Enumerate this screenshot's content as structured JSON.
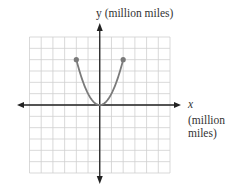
{
  "chart_data": {
    "type": "line",
    "title": "",
    "xlabel": "x (million miles)",
    "ylabel": "y (million miles)",
    "xlim": [
      -6,
      6
    ],
    "ylim": [
      -6,
      6
    ],
    "grid": true,
    "tick_labels": false,
    "series": [
      {
        "name": "y = x^2",
        "x": [
          -2,
          -1.5,
          -1,
          -0.5,
          0,
          0.5,
          1,
          1.5,
          2
        ],
        "y": [
          4,
          2.25,
          1,
          0.25,
          0,
          0.25,
          1,
          2.25,
          4
        ],
        "color": "#7a7a7a",
        "endpoints": [
          [
            -2,
            4
          ],
          [
            2,
            4
          ]
        ]
      }
    ]
  },
  "labels": {
    "y_axis": "y (million miles)",
    "x_axis_var": "x",
    "x_axis_unit_line1": "(million",
    "x_axis_unit_line2": "miles)"
  },
  "colors": {
    "grid": "#cfcfcf",
    "axis": "#222222",
    "curve": "#7a7a7a"
  }
}
